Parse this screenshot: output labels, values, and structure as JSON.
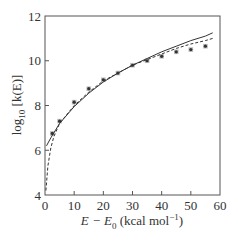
{
  "chart_data": {
    "type": "line",
    "title": "",
    "xlabel": "E − E0 (kcal mol−1)",
    "xlabel_parts": {
      "main": "E − E",
      "sub": "0",
      "unit": " (kcal mol",
      "sup": "−1",
      "close": ")"
    },
    "ylabel": "log10 [k(E)]",
    "ylabel_parts": {
      "pre": "log",
      "sub": "10",
      "post": " [k(E)]"
    },
    "xlim": [
      0,
      60
    ],
    "ylim": [
      4,
      12
    ],
    "xticks": [
      0,
      10,
      20,
      30,
      40,
      50,
      60
    ],
    "yticks": [
      4,
      6,
      8,
      10,
      12
    ],
    "grid": false,
    "legend": null,
    "series": [
      {
        "name": "experimental",
        "style": "markers",
        "marker": "filled-square-star",
        "x": [
          2.5,
          5,
          10,
          15,
          20,
          25,
          30,
          35,
          40,
          45,
          50,
          55
        ],
        "y": [
          6.75,
          7.3,
          8.15,
          8.75,
          9.15,
          9.45,
          9.8,
          10.0,
          10.2,
          10.4,
          10.5,
          10.65
        ]
      },
      {
        "name": "theory-solid",
        "style": "solid",
        "x": [
          0.5,
          2,
          5,
          10,
          15,
          20,
          25,
          30,
          35,
          40,
          45,
          50,
          55,
          57.5
        ],
        "y": [
          6.2,
          6.55,
          7.2,
          7.95,
          8.55,
          9.05,
          9.45,
          9.8,
          10.1,
          10.4,
          10.65,
          10.9,
          11.1,
          11.25
        ]
      },
      {
        "name": "theory-dashed",
        "style": "dashed",
        "x": [
          0.3,
          1,
          2,
          3,
          5,
          10,
          15,
          20,
          25,
          30,
          35,
          40,
          45,
          50,
          55,
          57.5
        ],
        "y": [
          4.2,
          5.3,
          6.1,
          6.6,
          7.2,
          8.0,
          8.6,
          9.1,
          9.45,
          9.8,
          10.05,
          10.3,
          10.55,
          10.75,
          10.9,
          11.0
        ]
      }
    ]
  },
  "plot_area": {
    "left": 45,
    "top": 16,
    "right": 220,
    "bottom": 195
  },
  "colors": {
    "axis": "#555555",
    "line": "#333333",
    "marker": "#333333"
  }
}
